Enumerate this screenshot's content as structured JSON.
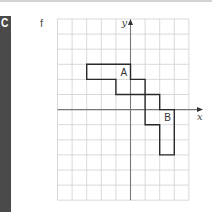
{
  "section": {
    "letter": "C",
    "strip_color": "#4a4a4a"
  },
  "part": {
    "label": "f"
  },
  "figure": {
    "type": "coordinate-grid",
    "columns": 9,
    "rows": 12,
    "origin_col": 5,
    "origin_row": 6,
    "x_axis_label": "x",
    "y_axis_label": "y",
    "grid_color": "#cfcfcf",
    "axis_color": "#777777",
    "shape_color": "#2a2a2a",
    "shape_outline_grid_vertices": [
      [
        2,
        3
      ],
      [
        5,
        3
      ],
      [
        5,
        4
      ],
      [
        6,
        4
      ],
      [
        6,
        5
      ],
      [
        7,
        5
      ],
      [
        7,
        6
      ],
      [
        8,
        6
      ],
      [
        8,
        9
      ],
      [
        7,
        9
      ],
      [
        7,
        7
      ],
      [
        6,
        7
      ],
      [
        6,
        5
      ],
      [
        4,
        5
      ],
      [
        4,
        4
      ],
      [
        2,
        4
      ]
    ],
    "regions": [
      {
        "label": "A",
        "label_cell": [
          4,
          3
        ]
      },
      {
        "label": "B",
        "label_cell": [
          7,
          6
        ]
      }
    ]
  }
}
